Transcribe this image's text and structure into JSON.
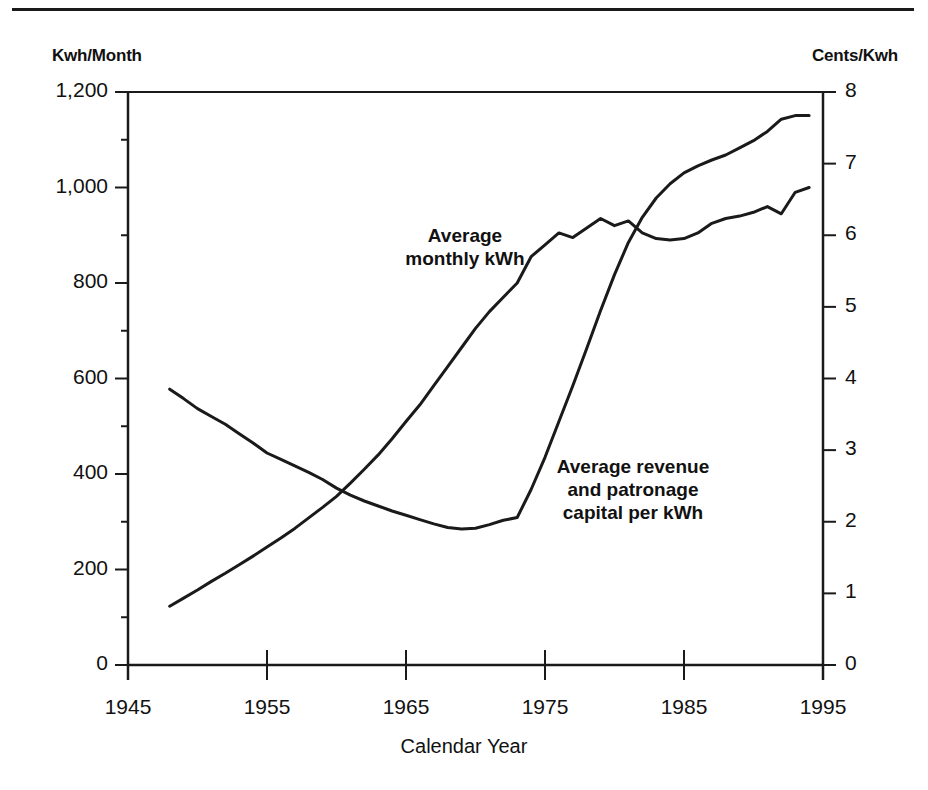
{
  "chart_data": {
    "type": "line",
    "title": "",
    "subtitle": "",
    "xlabel": "Calendar Year",
    "ylabel": "Kwh/Month",
    "y2label": "Cents/Kwh",
    "xlim": [
      1945,
      1995
    ],
    "ylim": [
      0,
      1200
    ],
    "y2lim": [
      0,
      8
    ],
    "grid": false,
    "legend_position": "inline-annotation",
    "xticks": [
      1945,
      1955,
      1965,
      1975,
      1985,
      1995
    ],
    "xtick_labels": [
      "1945",
      "1955",
      "1965",
      "1975",
      "1985",
      "1995"
    ],
    "yticks": [
      0,
      200,
      400,
      600,
      800,
      1000,
      1200
    ],
    "ytick_labels": [
      "0",
      "200",
      "400",
      "600",
      "800",
      "1,000",
      "1,200"
    ],
    "y2ticks": [
      0,
      1,
      2,
      3,
      4,
      5,
      6,
      7,
      8
    ],
    "y2tick_labels": [
      "0",
      "1",
      "2",
      "3",
      "4",
      "5",
      "6",
      "7",
      "8"
    ],
    "series": [
      {
        "name": "Average monthly kWh",
        "axis": "left",
        "units": "Kwh/Month",
        "annotation": "Average\nmonthly kWh",
        "color": "#1a1a1a",
        "x": [
          1948,
          1949,
          1950,
          1951,
          1952,
          1953,
          1954,
          1955,
          1956,
          1957,
          1958,
          1959,
          1960,
          1961,
          1962,
          1963,
          1964,
          1965,
          1966,
          1967,
          1968,
          1969,
          1970,
          1971,
          1972,
          1973,
          1974,
          1975,
          1976,
          1977,
          1978,
          1979,
          1980,
          1981,
          1982,
          1983,
          1984,
          1985,
          1986,
          1987,
          1988,
          1989,
          1990,
          1991,
          1992,
          1993,
          1994
        ],
        "y": [
          123,
          140,
          157,
          175,
          192,
          210,
          228,
          247,
          266,
          286,
          308,
          330,
          353,
          381,
          410,
          440,
          474,
          510,
          545,
          585,
          625,
          665,
          705,
          740,
          770,
          800,
          855,
          880,
          905,
          895,
          915,
          935,
          920,
          930,
          905,
          893,
          890,
          893,
          905,
          925,
          935,
          940,
          948,
          960,
          945,
          990,
          1000
        ]
      },
      {
        "name": "Average revenue and patronage capital per kWh",
        "axis": "right",
        "units": "Cents/Kwh",
        "annotation": "Average revenue\nand patronage\ncapital per kWh",
        "color": "#1a1a1a",
        "x": [
          1948,
          1949,
          1950,
          1951,
          1952,
          1953,
          1954,
          1955,
          1956,
          1957,
          1958,
          1959,
          1960,
          1961,
          1962,
          1963,
          1964,
          1965,
          1966,
          1967,
          1968,
          1969,
          1970,
          1971,
          1972,
          1973,
          1974,
          1975,
          1976,
          1977,
          1978,
          1979,
          1980,
          1981,
          1982,
          1983,
          1984,
          1985,
          1986,
          1987,
          1988,
          1989,
          1990,
          1991,
          1992,
          1993,
          1994
        ],
        "y_cents": [
          3.85,
          3.72,
          3.58,
          3.47,
          3.36,
          3.23,
          3.1,
          2.96,
          2.87,
          2.78,
          2.69,
          2.59,
          2.47,
          2.37,
          2.29,
          2.22,
          2.15,
          2.09,
          2.03,
          1.97,
          1.92,
          1.9,
          1.91,
          1.96,
          2.02,
          2.06,
          2.45,
          2.9,
          3.4,
          3.9,
          4.42,
          4.95,
          5.45,
          5.9,
          6.25,
          6.52,
          6.72,
          6.87,
          6.97,
          7.05,
          7.12,
          7.22,
          7.32,
          7.45,
          7.62,
          7.67,
          7.67
        ]
      }
    ],
    "notes": [
      "The average monthly kWh series is read on the left axis and rises from about 125 kWh in 1948 to about 1,000 kWh in 1994.",
      "The average revenue and patronage capital per kWh series is read on the right axis and falls from about 3.9 cents in 1948 to about 1.9 cents around 1969, then rises to about 7.7 cents by 1994.",
      "The two curves cross near 1960 and again near 1982."
    ]
  },
  "axis_labels": {
    "left_unit": "Kwh/Month",
    "right_unit": "Cents/Kwh",
    "x_title": "Calendar Year"
  },
  "annotations": {
    "kwh_line1": "Average",
    "kwh_line2": "monthly kWh",
    "revenue_line1": "Average revenue",
    "revenue_line2": "and patronage",
    "revenue_line3": "capital per kWh"
  },
  "colors": {
    "ink": "#1a1a1a",
    "background": "#ffffff"
  }
}
